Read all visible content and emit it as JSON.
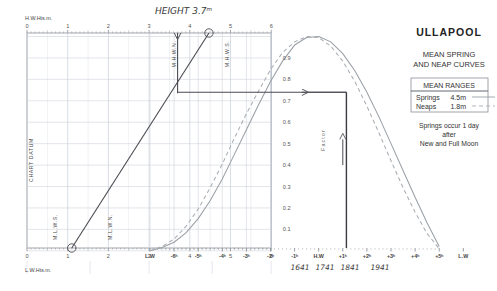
{
  "panel": {
    "title": "ULLAPOOL",
    "subtitle_line1": "MEAN SPRING",
    "subtitle_line2": "AND NEAP CURVES",
    "ranges_header": "MEAN RANGES",
    "ranges": [
      {
        "label": "Springs",
        "value": "4.5m",
        "style": "solid"
      },
      {
        "label": "Neaps",
        "value": "1.8m",
        "style": "dashed"
      }
    ],
    "note_line1": "Springs occur 1 day",
    "note_line2": "after",
    "note_line3": "New and Full Moon"
  },
  "axes": {
    "top_caption": "H.W.Hts.m.",
    "bottom_caption": "L.W.Hts.m.",
    "height_ticks": [
      "0",
      "1",
      "2",
      "3",
      "4",
      "5",
      "6"
    ],
    "factor_label": "Factor",
    "factor_ticks": [
      "0.1",
      "0.2",
      "0.3",
      "0.4",
      "0.5",
      "0.6",
      "0.7",
      "0.8",
      "0.9"
    ],
    "time_ticks": [
      "L.W",
      "-6ʰ",
      "-5ʰ",
      "-4ʰ",
      "-3ʰ",
      "-2ʰ",
      "-1ʰ",
      "H.W",
      "+1ʰ",
      "+2ʰ",
      "+3ʰ",
      "+4ʰ",
      "+5ʰ",
      "L.W"
    ],
    "datum_label": "CHART DATUM",
    "mhwn_label": "M.H.W.N.",
    "mhws_label": "M.H.W.S.",
    "mlwn_label": "M.L.W.N.",
    "mlws_label": "M.L.W.S."
  },
  "annotations": {
    "height_note": "HEIGHT 3.7ᵐ",
    "times": [
      "1641",
      "1741",
      "1841",
      "1941"
    ],
    "hw_height": 3.7,
    "lw_height": 1.1,
    "factor_value": 0.74
  },
  "colors": {
    "grid": "#c9cfd8",
    "axis": "#8b9098",
    "curve_spring": "#9aa0a6",
    "curve_neap": "#a8aeb4",
    "user_line": "#4a4a52",
    "ink": "#333333"
  },
  "chart_data": {
    "type": "line",
    "title": "ULLAPOOL MEAN SPRING AND NEAP CURVES",
    "xlabel": "Hours from High Water",
    "ylabel": "Factor",
    "x": [
      -6,
      -5.5,
      -5,
      -4.5,
      -4,
      -3.5,
      -3,
      -2.5,
      -2,
      -1.5,
      -1,
      -0.5,
      0,
      0.5,
      1,
      1.5,
      2,
      2.5,
      3,
      3.5,
      4,
      4.5,
      5,
      5.5,
      6
    ],
    "xlim": [
      -6,
      6
    ],
    "ylim": [
      0,
      1
    ],
    "grid": true,
    "legend_position": "right-panel",
    "series": [
      {
        "name": "Springs",
        "style": "solid",
        "mean_range": 4.5,
        "values": [
          0,
          0.015,
          0.04,
          0.085,
          0.15,
          0.235,
          0.335,
          0.45,
          0.565,
          0.68,
          0.79,
          0.885,
          0.96,
          0.995,
          1.0,
          0.975,
          0.92,
          0.84,
          0.74,
          0.625,
          0.5,
          0.375,
          0.25,
          0.13,
          0.02
        ]
      },
      {
        "name": "Neaps",
        "style": "dashed",
        "mean_range": 1.8,
        "values": [
          0,
          0.02,
          0.055,
          0.115,
          0.195,
          0.295,
          0.405,
          0.525,
          0.64,
          0.745,
          0.845,
          0.925,
          0.975,
          1.0,
          0.995,
          0.955,
          0.885,
          0.79,
          0.675,
          0.55,
          0.42,
          0.295,
          0.18,
          0.08,
          0.01
        ]
      }
    ],
    "height_scale": {
      "hw_axis_range": [
        0,
        6
      ],
      "lw_axis_range": [
        0,
        6
      ],
      "mhwn": 3.65,
      "mhws": 4.85,
      "mlwn": 2.07,
      "mlws": 0.73
    },
    "worked_example": {
      "hw_height": 3.7,
      "lw_height": 1.1,
      "factor": 0.74,
      "time_offset_hours": 2.15,
      "times": [
        "1641",
        "1741",
        "1841",
        "1941"
      ]
    }
  }
}
